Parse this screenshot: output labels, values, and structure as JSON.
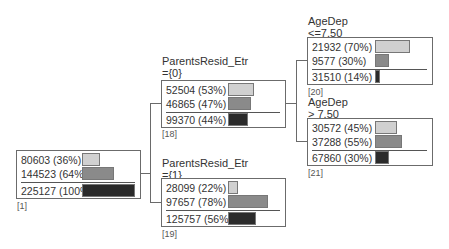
{
  "colors": {
    "class0": "#d0d0d0",
    "class1": "#8a8a8a",
    "total": "#2b2b2b",
    "border": "#6b6b6b"
  },
  "nodes": {
    "n1": {
      "id": "[1]",
      "title": "",
      "condition": "",
      "rows": [
        "80603 (36%)",
        "144523 (64%)"
      ],
      "total": "225127 (100%)",
      "pct": [
        36,
        64
      ],
      "total_pct": 100
    },
    "n18": {
      "id": "[18]",
      "title": "ParentsResid_Etr",
      "condition": "={0}",
      "rows": [
        "52504 (53%)",
        "46865 (47%)"
      ],
      "total": "99370 (44%)",
      "pct": [
        53,
        47
      ],
      "total_pct": 44
    },
    "n19": {
      "id": "[19]",
      "title": "ParentsResid_Etr",
      "condition": "={1}",
      "rows": [
        "28099 (22%)",
        "97657 (78%)"
      ],
      "total": "125757 (56%)",
      "pct": [
        22,
        78
      ],
      "total_pct": 56
    },
    "n20": {
      "id": "[20]",
      "title": "AgeDep",
      "condition": "<=7.50",
      "rows": [
        "21932 (70%)",
        "9577 (30%)"
      ],
      "total": "31510 (14%)",
      "pct": [
        70,
        30
      ],
      "total_pct": 14
    },
    "n21": {
      "id": "[21]",
      "title": "AgeDep",
      "condition": "> 7.50",
      "rows": [
        "30572 (45%)",
        "37288 (55%)"
      ],
      "total": "67860 (30%)",
      "pct": [
        45,
        55
      ],
      "total_pct": 30
    }
  }
}
